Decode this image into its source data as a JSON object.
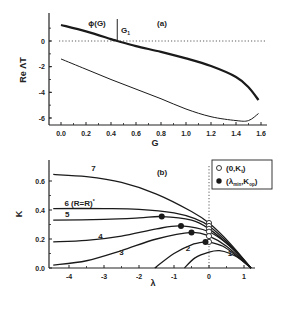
{
  "chart_data": [
    {
      "panel": "(a)",
      "type": "line",
      "title": "(a)",
      "xlabel": "G",
      "ylabel": "Re ΛT",
      "xlim": [
        -0.1,
        1.62
      ],
      "ylim": [
        -6.6,
        1.6
      ],
      "xticks": [
        "0.0",
        "0.2",
        "0.4",
        "0.6",
        "0.8",
        "1.0",
        "1.2",
        "1.4",
        "1.6"
      ],
      "yticks": [
        "0",
        "-2",
        "-4",
        "-6"
      ],
      "grid": false,
      "reference_line": {
        "y": 0,
        "style": "dotted"
      },
      "annotations": [
        {
          "text": "ϕ(G)",
          "x": 0.2,
          "y": 1.0
        },
        {
          "text": "G",
          "subscript": "1",
          "x": 0.46,
          "y": 0.6,
          "marker": "vertical line at G=0.45"
        }
      ],
      "series": [
        {
          "name": "ϕ(G) (upper, thick)",
          "x": [
            0.0,
            0.2,
            0.4,
            0.45,
            0.6,
            0.8,
            1.0,
            1.2,
            1.4,
            1.5,
            1.58
          ],
          "y": [
            1.25,
            0.75,
            0.15,
            0.0,
            -0.4,
            -0.85,
            -1.35,
            -1.95,
            -2.8,
            -3.6,
            -4.6
          ]
        },
        {
          "name": "lower (thin)",
          "x": [
            0.0,
            0.2,
            0.4,
            0.6,
            0.8,
            1.0,
            1.2,
            1.4,
            1.5,
            1.58
          ],
          "y": [
            -1.4,
            -2.2,
            -3.0,
            -3.75,
            -4.5,
            -5.3,
            -5.9,
            -6.2,
            -6.2,
            -5.65
          ]
        }
      ]
    },
    {
      "panel": "(b)",
      "type": "line",
      "title": "(b)",
      "xlabel": "λ",
      "ylabel": "K",
      "xlim": [
        -4.45,
        1.3
      ],
      "ylim": [
        0.0,
        0.68
      ],
      "xticks": [
        "-4",
        "-3",
        "-2",
        "-1",
        "0",
        "1"
      ],
      "yticks": [
        "0.0",
        "0.2",
        "0.4",
        "0.6"
      ],
      "grid": false,
      "reference_line": {
        "x": 0,
        "style": "dotted"
      },
      "legend": {
        "position": "upper right",
        "entries": [
          {
            "marker": "open circle",
            "label": "(0,K",
            "sub": "t",
            "suffix": ")"
          },
          {
            "marker": "filled circle",
            "label": "(λ",
            "sub": "min",
            "mid": ",K",
            "sub2": "op",
            "suffix": ")"
          }
        ]
      },
      "series": [
        {
          "name": "1",
          "x": [
            -0.7,
            -0.4,
            0.0,
            0.3,
            0.6,
            0.9,
            1.2
          ],
          "y": [
            0.0,
            0.07,
            0.11,
            0.12,
            0.1,
            0.06,
            0.0
          ]
        },
        {
          "name": "2",
          "x": [
            -1.55,
            -1.0,
            -0.5,
            -0.1,
            0.0,
            0.4,
            0.8,
            1.2
          ],
          "y": [
            0.0,
            0.1,
            0.16,
            0.18,
            0.18,
            0.15,
            0.08,
            0.0
          ]
        },
        {
          "name": "3",
          "x": [
            -4.45,
            -3.5,
            -2.5,
            -1.5,
            -0.5,
            0.0,
            0.5,
            1.2
          ],
          "y": [
            0.02,
            0.05,
            0.12,
            0.2,
            0.245,
            0.22,
            0.15,
            0.0
          ]
        },
        {
          "name": "4",
          "x": [
            -4.45,
            -3.5,
            -2.5,
            -1.5,
            -0.8,
            0.0,
            0.6,
            1.2
          ],
          "y": [
            0.18,
            0.19,
            0.22,
            0.27,
            0.29,
            0.25,
            0.15,
            0.0
          ]
        },
        {
          "name": "5",
          "x": [
            -4.45,
            -3.0,
            -2.0,
            -1.35,
            -0.5,
            0.0,
            0.6,
            1.2
          ],
          "y": [
            0.33,
            0.335,
            0.345,
            0.355,
            0.33,
            0.27,
            0.15,
            0.0
          ]
        },
        {
          "name": "6 (R=R*)",
          "x": [
            -4.45,
            -3.0,
            -2.0,
            -1.0,
            -0.4,
            0.0,
            0.6,
            1.2
          ],
          "y": [
            0.41,
            0.41,
            0.405,
            0.38,
            0.34,
            0.29,
            0.16,
            0.0
          ]
        },
        {
          "name": "7",
          "x": [
            -4.45,
            -3.5,
            -2.5,
            -1.5,
            -0.5,
            0.0,
            0.6,
            1.2
          ],
          "y": [
            0.645,
            0.63,
            0.59,
            0.51,
            0.39,
            0.31,
            0.17,
            0.0
          ]
        }
      ],
      "open_points": [
        [
          0,
          0.31
        ],
        [
          0,
          0.29
        ],
        [
          0,
          0.27
        ],
        [
          0,
          0.25
        ],
        [
          0,
          0.22
        ],
        [
          0,
          0.18
        ]
      ],
      "filled_points": [
        [
          -1.35,
          0.355
        ],
        [
          -0.8,
          0.29
        ],
        [
          -0.5,
          0.245
        ],
        [
          -0.1,
          0.18
        ]
      ],
      "curve_labels": [
        {
          "text": "1",
          "x": 0.6,
          "y": 0.08
        },
        {
          "text": "2",
          "x": -0.6,
          "y": 0.12
        },
        {
          "text": "3",
          "x": -2.5,
          "y": 0.09
        },
        {
          "text": "4",
          "x": -3.1,
          "y": 0.2
        },
        {
          "text": "5",
          "x": -4.05,
          "y": 0.35
        },
        {
          "text": "6 (R=R*)",
          "x": -3.7,
          "y": 0.43
        },
        {
          "text": "7",
          "x": -3.3,
          "y": 0.67
        }
      ]
    }
  ]
}
